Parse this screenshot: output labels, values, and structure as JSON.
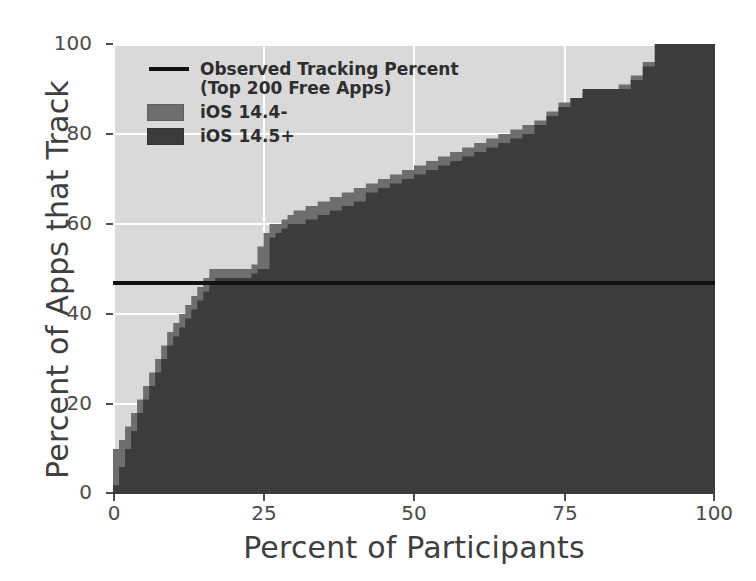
{
  "chart_data": {
    "type": "area",
    "title": "",
    "xlabel": "Percent of Participants",
    "ylabel": "Percent of Apps that Track",
    "xlim": [
      0,
      100
    ],
    "ylim": [
      0,
      100
    ],
    "xticks": [
      0,
      25,
      50,
      75,
      100
    ],
    "yticks": [
      0,
      20,
      40,
      60,
      80,
      100
    ],
    "xtick_labels": [
      "0",
      "25",
      "50",
      "75",
      "100"
    ],
    "ytick_labels": [
      "0",
      "20",
      "40",
      "60",
      "80",
      "100"
    ],
    "grid": true,
    "legend_position": "upper left",
    "annotations": {
      "reference_line_value": 47,
      "reference_line_label": "Observed Tracking Percent (Top 200 Free Apps)"
    },
    "series": [
      {
        "name": "iOS 14.4-",
        "color": "#6e6e6e",
        "x": [
          0,
          1,
          2,
          3,
          4,
          5,
          6,
          7,
          8,
          9,
          10,
          11,
          12,
          13,
          14,
          15,
          16,
          17,
          18,
          19,
          20,
          21,
          22,
          23,
          24,
          25,
          26,
          27,
          28,
          29,
          30,
          32,
          34,
          36,
          38,
          40,
          42,
          44,
          46,
          48,
          50,
          52,
          54,
          56,
          58,
          60,
          62,
          64,
          66,
          68,
          70,
          72,
          74,
          76,
          78,
          80,
          82,
          84,
          86,
          88,
          90,
          95,
          100
        ],
        "values": [
          10,
          12,
          15,
          18,
          21,
          24,
          27,
          30,
          33,
          36,
          38,
          40,
          42,
          44,
          46,
          48,
          50,
          50,
          50,
          50,
          50,
          50,
          50,
          51,
          55,
          58,
          60,
          60,
          61,
          62,
          63,
          64,
          65,
          66,
          67,
          68,
          69,
          70,
          71,
          72,
          73,
          74,
          75,
          76,
          77,
          78,
          79,
          80,
          81,
          82,
          83,
          85,
          87,
          88,
          89,
          90,
          90,
          91,
          93,
          96,
          100,
          100,
          100
        ]
      },
      {
        "name": "iOS 14.5+",
        "color": "#3c3c3c",
        "x": [
          0,
          1,
          2,
          3,
          4,
          5,
          6,
          7,
          8,
          9,
          10,
          11,
          12,
          13,
          14,
          15,
          16,
          17,
          18,
          19,
          20,
          21,
          22,
          23,
          24,
          25,
          26,
          27,
          28,
          29,
          30,
          32,
          34,
          36,
          38,
          40,
          42,
          44,
          46,
          48,
          50,
          52,
          54,
          56,
          58,
          60,
          62,
          64,
          66,
          68,
          70,
          72,
          74,
          76,
          78,
          80,
          82,
          84,
          86,
          88,
          90,
          95,
          100
        ],
        "values": [
          2,
          6,
          10,
          14,
          18,
          21,
          24,
          27,
          30,
          33,
          35,
          37,
          39,
          41,
          43,
          45,
          47,
          48,
          48,
          48,
          48,
          48,
          48,
          49,
          50,
          50,
          57,
          58,
          59,
          60,
          60,
          61,
          62,
          63,
          64,
          65,
          67,
          68,
          69,
          70,
          71,
          72,
          73,
          74,
          75,
          76,
          77,
          78,
          79,
          80,
          82,
          84,
          86,
          88,
          90,
          90,
          90,
          90,
          92,
          95,
          100,
          100,
          100
        ]
      }
    ]
  },
  "axes": {
    "xlabel": "Percent of Participants",
    "ylabel": "Percent of Apps that Track",
    "xtick_labels": [
      "0",
      "25",
      "50",
      "75",
      "100"
    ],
    "ytick_labels": [
      "0",
      "20",
      "40",
      "60",
      "80",
      "100"
    ]
  },
  "legend": {
    "items": [
      {
        "type": "line",
        "label": "Observed Tracking Percent\n(Top 200 Free Apps)",
        "color": "#111111"
      },
      {
        "type": "patch",
        "label": "iOS 14.4-",
        "color": "#6e6e6e"
      },
      {
        "type": "patch",
        "label": "iOS 14.5+",
        "color": "#3c3c3c"
      }
    ]
  },
  "colors": {
    "plot_background": "#d9d9d9",
    "gridline": "#ffffff",
    "reference_line": "#111111",
    "ios_144_minus": "#6e6e6e",
    "ios_145_plus": "#3c3c3c",
    "tick_label": "#4a4a4a",
    "axis_label": "#3f3f3f"
  }
}
